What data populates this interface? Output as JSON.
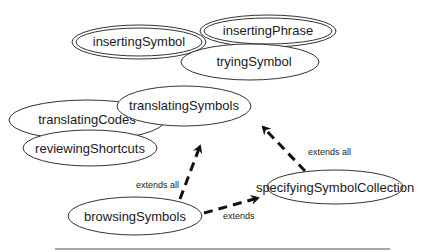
{
  "diagram": {
    "nodes": [
      {
        "id": "insertingSymbol",
        "label": "insertingSymbol",
        "cx": 139,
        "cy": 42,
        "rx": 67,
        "ry": 17,
        "double": true
      },
      {
        "id": "insertingPhrase",
        "label": "insertingPhrase",
        "cx": 268,
        "cy": 31,
        "rx": 68,
        "ry": 16,
        "double": true
      },
      {
        "id": "tryingSymbol",
        "label": "tryingSymbol",
        "cx": 250,
        "cy": 62,
        "rx": 69,
        "ry": 18,
        "double": false
      },
      {
        "id": "translatingCodes",
        "label": "translatingCodes",
        "cx": 87,
        "cy": 120,
        "rx": 78,
        "ry": 20,
        "double": false
      },
      {
        "id": "translatingSymbols",
        "label": "translatingSymbols",
        "cx": 184,
        "cy": 106,
        "rx": 67,
        "ry": 20,
        "double": false
      },
      {
        "id": "reviewingShortcuts",
        "label": "reviewingShortcuts",
        "cx": 90,
        "cy": 148,
        "rx": 67,
        "ry": 18,
        "double": false
      },
      {
        "id": "browsingSymbols",
        "label": "browsingSymbols",
        "cx": 135,
        "cy": 216,
        "rx": 67,
        "ry": 19,
        "double": false
      },
      {
        "id": "specifyingSymbolCollection",
        "label": "specifyingSymbolCollection",
        "cx": 335,
        "cy": 187,
        "rx": 68,
        "ry": 17,
        "double": false
      }
    ],
    "edges": [
      {
        "from": "browsingSymbols",
        "to": "translatingSymbols",
        "label": "extends all"
      },
      {
        "from": "browsingSymbols",
        "to": "specifyingSymbolCollection",
        "label": "extends"
      },
      {
        "from": "specifyingSymbolCollection",
        "to": "translatingSymbols",
        "label": "extends all"
      }
    ],
    "edge_labels": {
      "browse_to_translate": "extends all",
      "browse_to_specify": "extends",
      "specify_to_translate": "extends all"
    }
  }
}
